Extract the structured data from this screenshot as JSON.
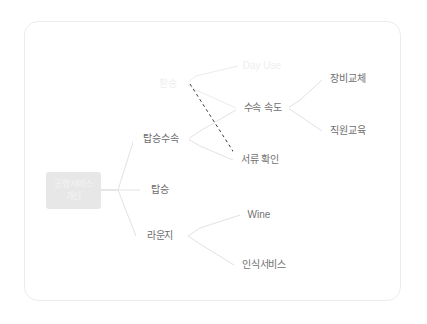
{
  "canvas": {
    "background_color": "#ffffff",
    "card_border_color": "#ececec"
  },
  "diagram": {
    "type": "tree",
    "orientation": "left-to-right",
    "edge_color": "#e0e0e0",
    "dashed_edge_color": "#3a3a3a",
    "root_fill_color": "#e7e7e7",
    "root_text_color": "#f4f4f4",
    "label_text_color": "#6d6d6d",
    "faded_text_color": "#ededed",
    "root": {
      "id": "root",
      "label_line1": "공항서비스",
      "label_line2": "개선"
    },
    "nodes": [
      {
        "id": "transfer",
        "label": "환승",
        "level": 1,
        "style": "faded"
      },
      {
        "id": "boarding-proc",
        "label": "탑승수속",
        "level": 1,
        "style": "normal"
      },
      {
        "id": "boarding",
        "label": "탑승",
        "level": 1,
        "style": "normal"
      },
      {
        "id": "lounge",
        "label": "라운지",
        "level": 1,
        "style": "normal"
      },
      {
        "id": "day-use",
        "label": "Day Use",
        "level": 2,
        "style": "faded"
      },
      {
        "id": "checkin-speed",
        "label": "수속 속도",
        "level": 2,
        "style": "normal"
      },
      {
        "id": "document-check",
        "label": "서류 확인",
        "level": 2,
        "style": "normal"
      },
      {
        "id": "wine",
        "label": "Wine",
        "level": 2,
        "style": "normal"
      },
      {
        "id": "recognition",
        "label": "인식서비스",
        "level": 2,
        "style": "normal"
      },
      {
        "id": "equipment",
        "label": "장비교체",
        "level": 3,
        "style": "normal"
      },
      {
        "id": "staff-training",
        "label": "직원교육",
        "level": 3,
        "style": "normal"
      }
    ],
    "edges": [
      {
        "from": "root",
        "to": "boarding-proc",
        "style": "solid"
      },
      {
        "from": "root",
        "to": "boarding",
        "style": "solid"
      },
      {
        "from": "root",
        "to": "lounge",
        "style": "solid"
      },
      {
        "from": "transfer",
        "to": "day-use",
        "style": "solid"
      },
      {
        "from": "transfer",
        "to": "checkin-speed",
        "style": "solid"
      },
      {
        "from": "boarding-proc",
        "to": "checkin-speed",
        "style": "solid"
      },
      {
        "from": "boarding-proc",
        "to": "document-check",
        "style": "solid"
      },
      {
        "from": "transfer",
        "to": "document-check",
        "style": "dashed"
      },
      {
        "from": "checkin-speed",
        "to": "equipment",
        "style": "solid"
      },
      {
        "from": "checkin-speed",
        "to": "staff-training",
        "style": "solid"
      },
      {
        "from": "lounge",
        "to": "wine",
        "style": "solid"
      },
      {
        "from": "lounge",
        "to": "recognition",
        "style": "solid"
      }
    ]
  }
}
